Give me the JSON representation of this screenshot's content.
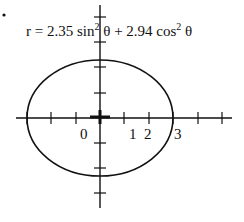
{
  "equation": {
    "prefix": "r = 2.35 sin",
    "exp1": "2",
    "middle": " θ + 2.94 cos",
    "exp2": "2",
    "suffix": " θ"
  },
  "axis_labels": {
    "zero": "0",
    "one": "1",
    "two": "2",
    "three": "3"
  },
  "colors": {
    "stroke": "#111111",
    "background": "#ffffff"
  }
}
